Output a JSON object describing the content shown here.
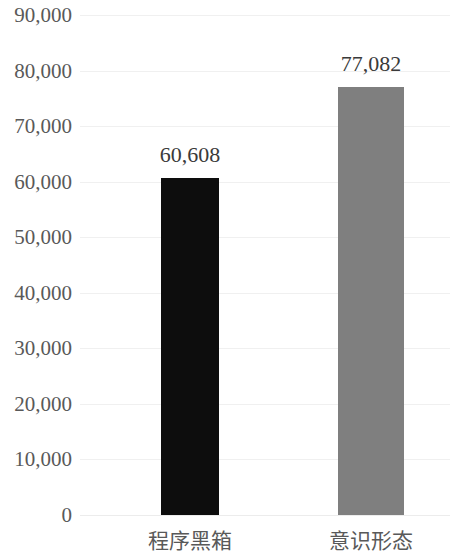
{
  "chart_data": {
    "type": "bar",
    "title": "",
    "subtitle": "",
    "xlabel": "",
    "ylabel": "",
    "categories": [
      "程序黑箱",
      "意识形态"
    ],
    "values": [
      60608,
      77082
    ],
    "value_labels": [
      "60,608",
      "77,082"
    ],
    "bar_colors": [
      "#0d0d0d",
      "#7f7f7f"
    ],
    "ylim": [
      0,
      90000
    ],
    "ytick_values": [
      90000,
      80000,
      70000,
      60000,
      50000,
      40000,
      30000,
      20000,
      10000,
      0
    ],
    "ytick_labels": [
      "90,000",
      "80,000",
      "70,000",
      "60,000",
      "50,000",
      "40,000",
      "30,000",
      "20,000",
      "10,000",
      "0"
    ],
    "grid": true,
    "grid_color": "#f0f0f0",
    "axis_label_color": "#595959",
    "value_label_color": "#3a3a3a",
    "legend": null,
    "legend_position": "none"
  }
}
